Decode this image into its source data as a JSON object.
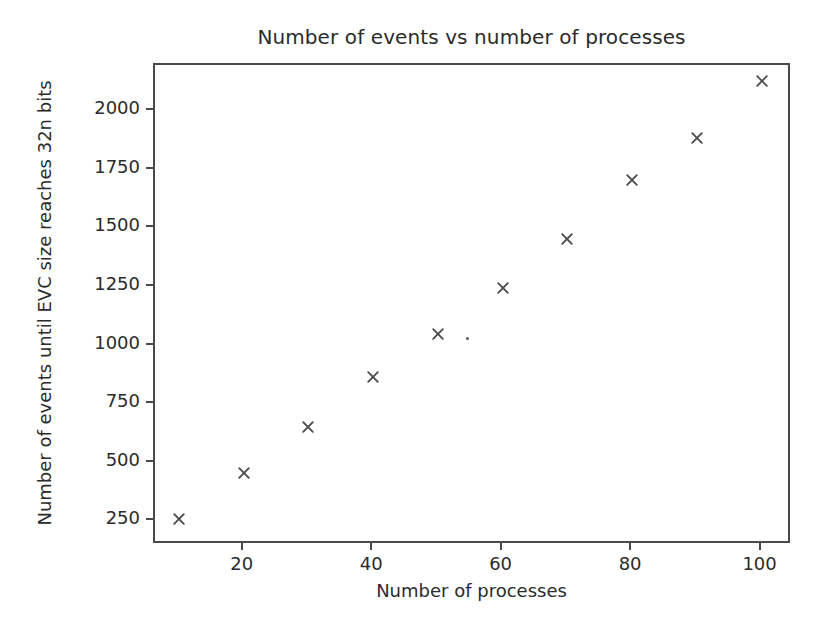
{
  "chart_data": {
    "type": "scatter",
    "title": "Number of events vs number of processes",
    "xlabel": "Number of processes",
    "ylabel": "Number of events until EVC size reaches 32n bits",
    "x": [
      10,
      20,
      30,
      40,
      50,
      60,
      70,
      80,
      90,
      100
    ],
    "values": [
      260,
      455,
      650,
      865,
      1050,
      1245,
      1455,
      1705,
      1885,
      2130
    ],
    "series": [
      {
        "name": "EVC size threshold",
        "marker": "x",
        "color": "#4d4d4d",
        "points": [
          {
            "x": 10,
            "y": 260
          },
          {
            "x": 20,
            "y": 455
          },
          {
            "x": 30,
            "y": 650
          },
          {
            "x": 40,
            "y": 865
          },
          {
            "x": 50,
            "y": 1050
          },
          {
            "x": 60,
            "y": 1245
          },
          {
            "x": 70,
            "y": 1455
          },
          {
            "x": 80,
            "y": 1705
          },
          {
            "x": 90,
            "y": 1885
          },
          {
            "x": 100,
            "y": 2130
          }
        ]
      }
    ],
    "xticks": [
      20,
      40,
      60,
      80,
      100
    ],
    "xtick_labels": [
      "20",
      "40",
      "60",
      "80",
      "100"
    ],
    "yticks": [
      250,
      500,
      750,
      1000,
      1250,
      1500,
      1750,
      2000
    ],
    "ytick_labels": [
      "250",
      "500",
      "750",
      "1000",
      "1250",
      "1500",
      "1750",
      "2000"
    ],
    "xlim": [
      6.3,
      104.7
    ],
    "ylim": [
      148,
      2198
    ],
    "grid": false,
    "legend": null,
    "artifacts": [
      {
        "name": "scan-speck",
        "x": 54.6,
        "y": 1030
      }
    ],
    "style": {
      "background": "#ffffff",
      "axis_color": "#4a4a4a",
      "text_color": "#2b2b2b",
      "marker_color": "#4d4d4d"
    }
  }
}
